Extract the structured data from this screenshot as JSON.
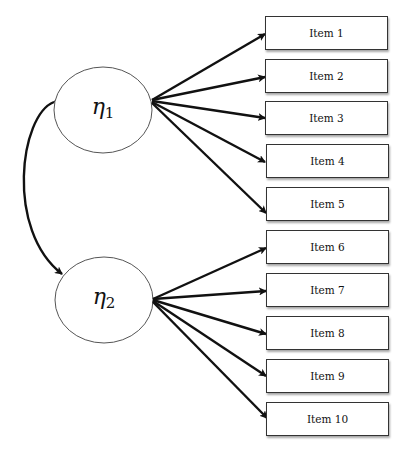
{
  "diagram": {
    "type": "confirmatory-factor-analysis-path-diagram",
    "factors": [
      {
        "id": "eta1",
        "symbol": "η",
        "subscript": "1",
        "items": [
          "Item 1",
          "Item 2",
          "Item 3",
          "Item 4",
          "Item 5"
        ]
      },
      {
        "id": "eta2",
        "symbol": "η",
        "subscript": "2",
        "items": [
          "Item 6",
          "Item 7",
          "Item 8",
          "Item 9",
          "Item 10"
        ]
      }
    ],
    "covariance": {
      "from": "eta1",
      "to": "eta2",
      "style": "curved-double-headed-arrow"
    },
    "items": [
      "Item 1",
      "Item 2",
      "Item 3",
      "Item 4",
      "Item 5",
      "Item 6",
      "Item 7",
      "Item 8",
      "Item 9",
      "Item 10"
    ]
  },
  "colors": {
    "stroke": "#111111",
    "ellipse_border": "#555555",
    "background": "#ffffff"
  }
}
